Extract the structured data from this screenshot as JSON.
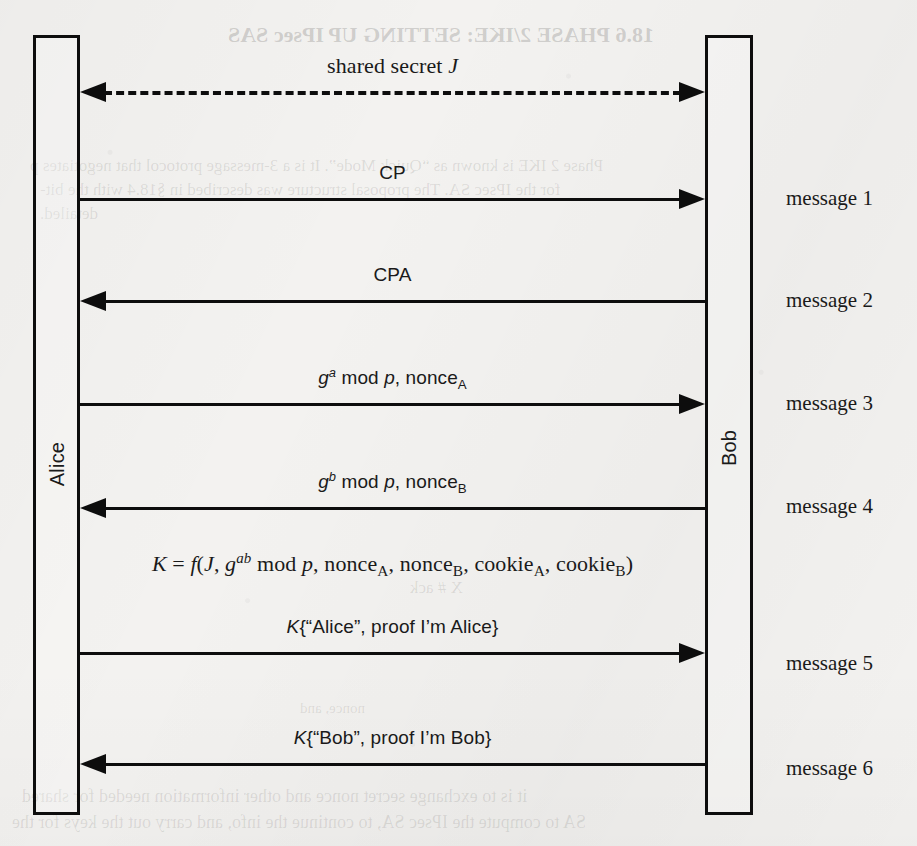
{
  "figure": {
    "type": "protocol-sequence-diagram",
    "background_color": "#f3f2f0",
    "ink_color": "#0d0d0d",
    "principals": [
      {
        "name": "alice",
        "label": "Alice",
        "side": "left"
      },
      {
        "name": "bob",
        "label": "Bob",
        "side": "right"
      }
    ],
    "shared_secret": {
      "label_plain": "shared secret J",
      "label_prefix": "shared secret ",
      "label_symbol": "J",
      "style": "dashed",
      "direction": "both"
    },
    "messages": [
      {
        "index": 1,
        "right_label": "message 1",
        "direction": "right",
        "font": "sans",
        "text_plain": "CP",
        "parts": [
          {
            "t": "CP",
            "s": "plain"
          }
        ]
      },
      {
        "index": 2,
        "right_label": "message 2",
        "direction": "left",
        "font": "sans",
        "text_plain": "CPA",
        "parts": [
          {
            "t": "CPA",
            "s": "plain"
          }
        ]
      },
      {
        "index": 3,
        "right_label": "message 3",
        "direction": "right",
        "font": "sans",
        "text_plain": "g^a mod p, nonce_A",
        "parts": [
          {
            "t": "g",
            "s": "italic"
          },
          {
            "t": "a",
            "s": "sup"
          },
          {
            "t": " mod ",
            "s": "plain"
          },
          {
            "t": "p",
            "s": "italic"
          },
          {
            "t": ", nonce",
            "s": "plain"
          },
          {
            "t": "A",
            "s": "sub"
          }
        ]
      },
      {
        "index": 4,
        "right_label": "message 4",
        "direction": "left",
        "font": "sans",
        "text_plain": "g^b mod p, nonce_B",
        "parts": [
          {
            "t": "g",
            "s": "italic"
          },
          {
            "t": "b",
            "s": "sup"
          },
          {
            "t": " mod ",
            "s": "plain"
          },
          {
            "t": "p",
            "s": "italic"
          },
          {
            "t": ", nonce",
            "s": "plain"
          },
          {
            "t": "B",
            "s": "sub"
          }
        ]
      },
      {
        "index": 5,
        "right_label": "message 5",
        "direction": "right",
        "font": "sans",
        "text_plain": "K{\"Alice\", proof I'm Alice}",
        "parts": [
          {
            "t": "K",
            "s": "italic"
          },
          {
            "t": "{“Alice”, proof I’m Alice}",
            "s": "plain"
          }
        ]
      },
      {
        "index": 6,
        "right_label": "message 6",
        "direction": "left",
        "font": "sans",
        "text_plain": "K{\"Bob\", proof I'm Bob}",
        "parts": [
          {
            "t": "K",
            "s": "italic"
          },
          {
            "t": "{“Bob”, proof I’m Bob}",
            "s": "plain"
          }
        ]
      }
    ],
    "key_derivation": {
      "text_plain": "K = f(J, g^ab mod p, nonce_A, nonce_B, cookie_A, cookie_B)",
      "parts": [
        {
          "t": "K",
          "s": "italic"
        },
        {
          "t": " = ",
          "s": "plain"
        },
        {
          "t": "f",
          "s": "italic"
        },
        {
          "t": "(",
          "s": "plain"
        },
        {
          "t": "J",
          "s": "italic"
        },
        {
          "t": ", ",
          "s": "plain"
        },
        {
          "t": "g",
          "s": "italic"
        },
        {
          "t": "ab",
          "s": "sup"
        },
        {
          "t": " mod ",
          "s": "plain"
        },
        {
          "t": "p",
          "s": "italic"
        },
        {
          "t": ", nonce",
          "s": "plain"
        },
        {
          "t": "A",
          "s": "sub"
        },
        {
          "t": ", nonce",
          "s": "plain"
        },
        {
          "t": "B",
          "s": "sub"
        },
        {
          "t": ", cookie",
          "s": "plain"
        },
        {
          "t": "A",
          "s": "sub"
        },
        {
          "t": ", cookie",
          "s": "plain"
        },
        {
          "t": "B",
          "s": "sub"
        },
        {
          "t": ")",
          "s": "plain"
        }
      ]
    },
    "bleed_through": [
      {
        "text": "18.6 PHASE 2/IKE: SETTING UP IPsec SAS",
        "x": 228,
        "y": 22,
        "size": 22,
        "weight": "bold"
      },
      {
        "text": "Phase 2 IKE is known as “Quick Mode”. It is a 3-message protocol that negotiates p",
        "x": 30,
        "y": 156,
        "size": 17,
        "weight": "normal"
      },
      {
        "text": "for the IPsec SA. The proposal structure was described in §18.4 with the bit-",
        "x": 40,
        "y": 180,
        "size": 17,
        "weight": "normal"
      },
      {
        "text": "detailed.",
        "x": 40,
        "y": 204,
        "size": 17,
        "weight": "normal"
      },
      {
        "text": "X # ack",
        "x": 410,
        "y": 578,
        "size": 17,
        "weight": "normal"
      },
      {
        "text": "nonce, and",
        "x": 300,
        "y": 700,
        "size": 15,
        "weight": "normal"
      },
      {
        "text": "it is to exchange secret nonce and other information needed for shared",
        "x": 22,
        "y": 786,
        "size": 18,
        "weight": "normal"
      },
      {
        "text": "SA to compute the IPsec SA, to continue the info, and carry out the keys for the",
        "x": 12,
        "y": 812,
        "size": 18,
        "weight": "normal"
      }
    ]
  },
  "geometry": {
    "alice_box": {
      "x": 33,
      "y": 35,
      "w": 47,
      "h": 780
    },
    "bob_box": {
      "x": 705,
      "y": 35,
      "w": 48,
      "h": 780
    },
    "shared_secret_y": 91,
    "message_line_y": [
      198,
      300,
      403,
      507,
      652,
      763
    ],
    "message_label_y": [
      200,
      302,
      405,
      508,
      665,
      770
    ],
    "key_line_y": 567,
    "right_label_x": 786,
    "arrow_span": {
      "left_x": 80,
      "right_x": 705
    }
  }
}
